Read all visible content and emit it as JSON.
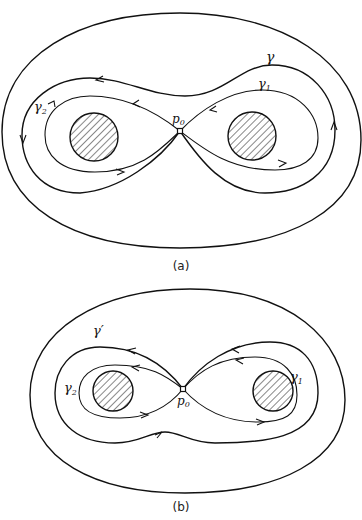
{
  "figure_a": {
    "caption": "(a)",
    "labels": {
      "gamma": "γ",
      "gamma1": "γ",
      "gamma1_sub": "1",
      "gamma2": "γ",
      "gamma2_sub": "2",
      "p0": "p",
      "p0_sub": "0"
    }
  },
  "figure_b": {
    "caption": "(b)",
    "labels": {
      "gamma_prime": "γ′",
      "gamma1": "γ",
      "gamma1_sub": "1",
      "gamma2": "γ",
      "gamma2_sub": "2",
      "p0": "p",
      "p0_sub": "0"
    }
  },
  "colors": {
    "line": "#111111",
    "background": "#ffffff"
  }
}
